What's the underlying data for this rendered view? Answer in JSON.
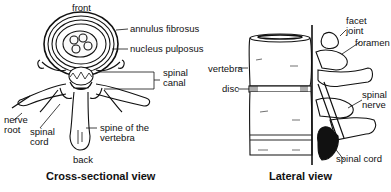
{
  "cross_section": {
    "caption": "Cross-sectional view",
    "labels": {
      "front": "front",
      "annulus": "annulus fibrosus",
      "nucleus": "nucleus pulposus",
      "canal_1": "spinal",
      "canal_2": "canal",
      "nerve_root_1": "nerve",
      "nerve_root_2": "root",
      "cord_1": "spinal",
      "cord_2": "cord",
      "spine_1": "spine of the",
      "spine_2": "vertebra",
      "back": "back"
    }
  },
  "lateral": {
    "caption": "Lateral view",
    "labels": {
      "facet_1": "facet",
      "facet_2": "joint",
      "foramen": "foramen",
      "vertebra": "vertebra",
      "disc": "disc",
      "nerve_1": "spinal",
      "nerve_2": "nerve",
      "cord": "spinal cord"
    }
  },
  "colors": {
    "ink": "#111111",
    "background": "#ffffff"
  }
}
